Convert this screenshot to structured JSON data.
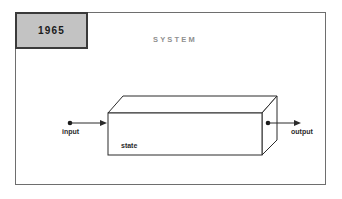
{
  "diagram": {
    "year_badge": {
      "label": "1965"
    },
    "title": "SYSTEM",
    "box": {
      "state_label": "state"
    },
    "ports": {
      "input_label": "input",
      "output_label": "output"
    },
    "colors": {
      "frame_border": "#6e6e6e",
      "badge_fill": "#c3c3c3",
      "badge_border": "#3a3a3a",
      "title_color": "#8f8f8f",
      "line_color": "#2b2b2b",
      "box_face": "#ffffff",
      "label_color": "#2b2b2b"
    }
  }
}
